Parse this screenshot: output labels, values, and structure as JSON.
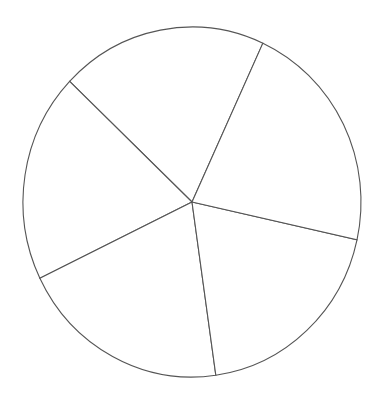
{
  "chart_data": {
    "type": "pie",
    "title": "",
    "labels": [
      "",
      "",
      "",
      "",
      ""
    ],
    "values": [
      19.8,
      19.3,
      20.1,
      19.3,
      21.6
    ],
    "start_angle_deg": 65.2,
    "direction": "counterclockwise",
    "center": [
      192,
      202
    ],
    "radius": [
      169,
      175
    ],
    "colors": [
      "#ffffff",
      "#ffffff",
      "#ffffff",
      "#ffffff",
      "#ffffff"
    ],
    "edge_color": "#555555",
    "legend": false
  }
}
